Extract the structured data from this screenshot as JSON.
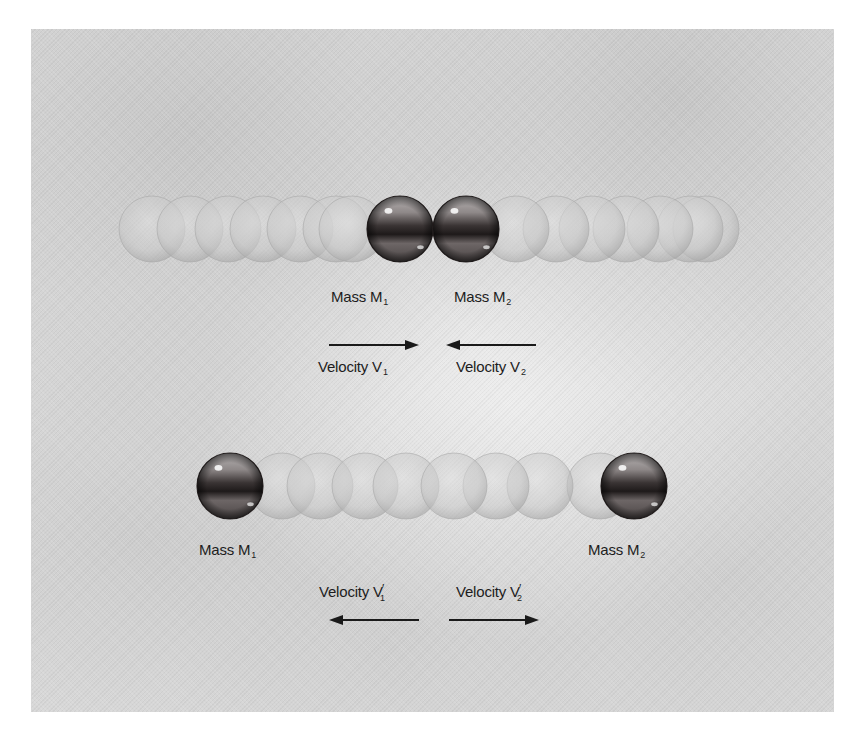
{
  "diagram": {
    "colors": {
      "background": "#dcdcdc",
      "frame_outside": "#ffffff",
      "ghost_ball": "#c8c8c8",
      "solid_ball_dark": "#2e2a2a",
      "text": "#1d1d1d",
      "arrow": "#1a1a1a"
    },
    "before_collision": {
      "mass1_label": {
        "text": "Mass M",
        "sub": "1"
      },
      "mass2_label": {
        "text": "Mass M",
        "sub": "2"
      },
      "velocity1_label": {
        "text": "Velocity V",
        "sub": "1"
      },
      "velocity2_label": {
        "text": "Velocity V",
        "sub": "2"
      },
      "arrow1_direction": "right",
      "arrow2_direction": "left",
      "row_center_y": 229,
      "ball_radius": 33,
      "ghost_balls_left_x": [
        152,
        190,
        228,
        263,
        300,
        336,
        352
      ],
      "ghost_balls_right_x": [
        516,
        556,
        592,
        626,
        660,
        690,
        706
      ],
      "solid_ball_m1_x": 400,
      "solid_ball_m2_x": 466
    },
    "after_collision": {
      "mass1_label": {
        "text": "Mass M",
        "sub": "1"
      },
      "mass2_label": {
        "text": "Mass M",
        "sub": "2"
      },
      "velocity1_label": {
        "text": "Velocity V",
        "prime": "′",
        "sub": "1"
      },
      "velocity2_label": {
        "text": "Velocity V",
        "prime": "′",
        "sub": "2"
      },
      "arrow1_direction": "left",
      "arrow2_direction": "right",
      "row_center_y": 486,
      "ball_radius": 33,
      "ghost_balls_left_x": [
        282,
        320,
        365,
        406
      ],
      "ghost_balls_right_x": [
        454,
        496,
        540,
        600
      ],
      "solid_ball_m1_x": 230,
      "solid_ball_m2_x": 634
    }
  }
}
